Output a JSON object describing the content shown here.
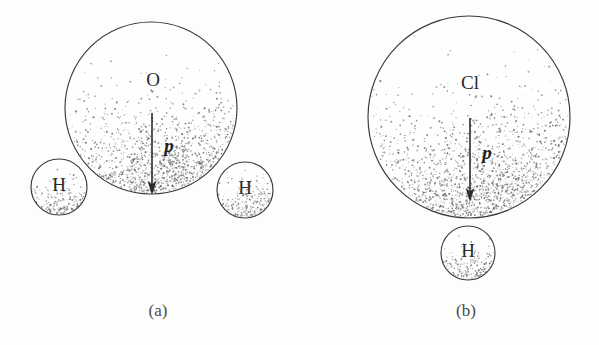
{
  "figure": {
    "background_color": "#fdfdfc",
    "ink_color": "#2b2b2b",
    "outline_color": "#3a3a3a",
    "stipple_color": "#6b6b6b",
    "width": 599,
    "height": 345
  },
  "panels": [
    {
      "id": "panel-a",
      "caption": "(a)",
      "caption_x": 158,
      "caption_y": 312,
      "molecule": "water",
      "vector_label": "p",
      "atoms": [
        {
          "name": "O",
          "label": "O",
          "cx": 151,
          "cy": 108,
          "r": 86,
          "label_x": 153,
          "label_y": 82
        },
        {
          "name": "H1",
          "label": "H",
          "cx": 59,
          "cy": 187,
          "r": 28,
          "label_x": 59,
          "label_y": 187
        },
        {
          "name": "H2",
          "label": "H",
          "cx": 245,
          "cy": 190,
          "r": 28,
          "label_x": 245,
          "label_y": 190
        }
      ],
      "arrow": {
        "x": 152,
        "y_start": 113,
        "y_end": 193,
        "label": "p",
        "label_x": 169,
        "label_y": 148
      }
    },
    {
      "id": "panel-b",
      "caption": "(b)",
      "caption_x": 466,
      "caption_y": 312,
      "molecule": "hydrogen-chloride",
      "vector_label": "p",
      "atoms": [
        {
          "name": "Cl",
          "label": "Cl",
          "cx": 469,
          "cy": 117,
          "r": 101,
          "label_x": 470,
          "label_y": 85
        },
        {
          "name": "H",
          "label": "H",
          "cx": 468,
          "cy": 253,
          "r": 27,
          "label_x": 468,
          "label_y": 253
        }
      ],
      "arrow": {
        "x": 470,
        "y_start": 118,
        "y_end": 200,
        "label": "p",
        "label_x": 487,
        "label_y": 155
      }
    }
  ]
}
